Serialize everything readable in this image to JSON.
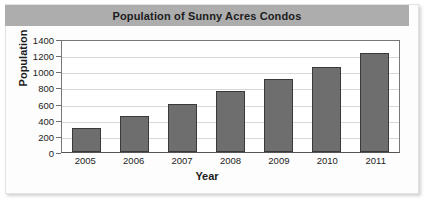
{
  "chart_data": {
    "type": "bar",
    "title": "Population of Sunny Acres Condos",
    "xlabel": "Year",
    "ylabel": "Population",
    "categories": [
      "2005",
      "2006",
      "2007",
      "2008",
      "2009",
      "2010",
      "2011"
    ],
    "values": [
      300,
      450,
      600,
      750,
      900,
      1050,
      1225
    ],
    "ylim": [
      0,
      1400
    ],
    "yticks": [
      0,
      200,
      400,
      600,
      800,
      1000,
      1200,
      1400
    ],
    "ytick_labels": [
      "0",
      "200",
      "400",
      "600",
      "800",
      "1000",
      "1200",
      "1400"
    ],
    "grid": true,
    "legend": false,
    "colors": {
      "bar_fill": "#6e6e6e",
      "bar_border": "#3a3a3a",
      "title_band": "#adadad",
      "gridline": "#d8d8d8",
      "plot_background": "#ffffff",
      "figure_background": "#fdfdfd",
      "text": "#1c1c1c"
    }
  }
}
